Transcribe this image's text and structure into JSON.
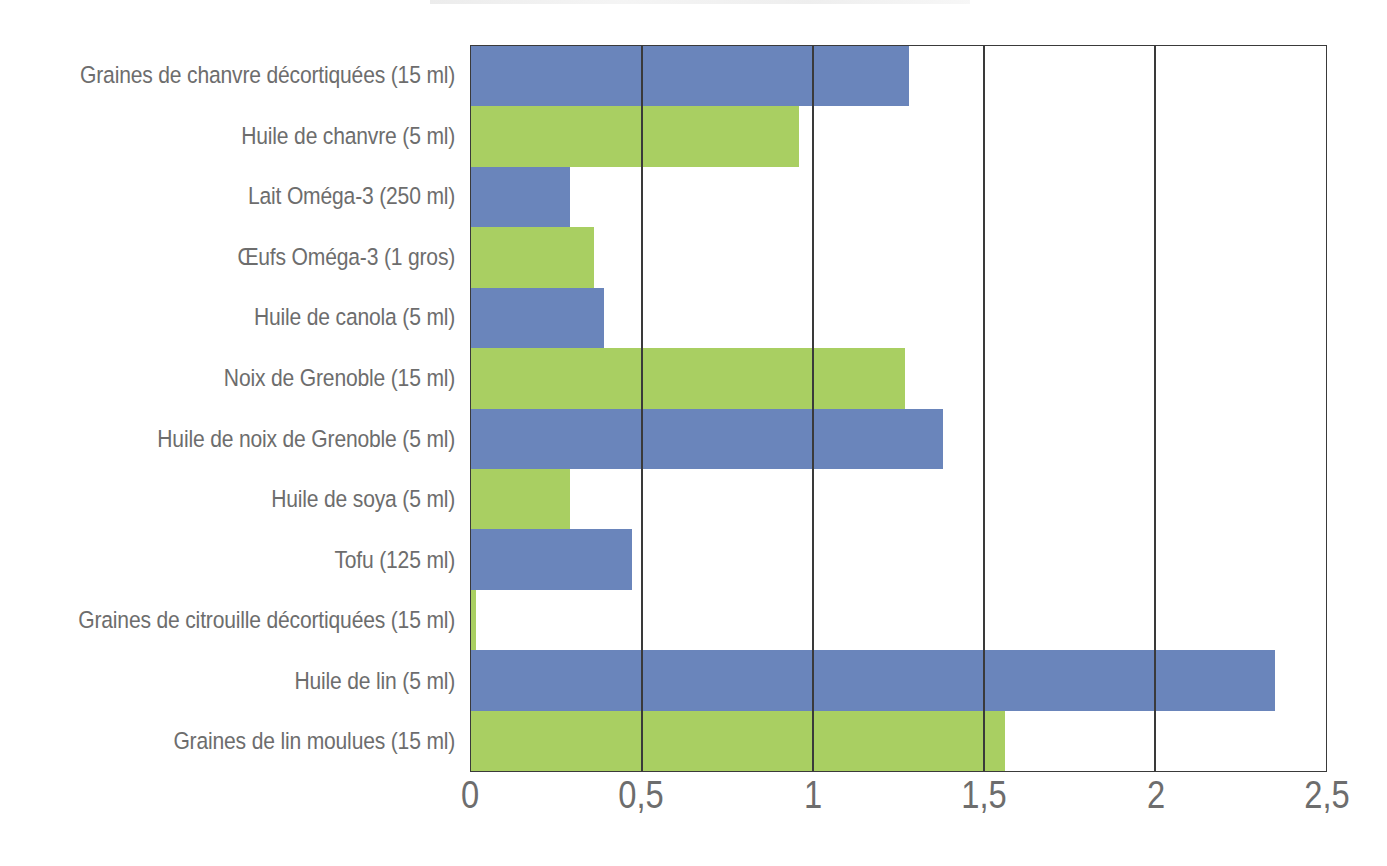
{
  "chart_data": {
    "type": "bar",
    "orientation": "horizontal",
    "title": "",
    "xlabel": "",
    "ylabel": "",
    "xlim": [
      0,
      2.5
    ],
    "xticks": [
      0,
      0.5,
      1,
      1.5,
      2,
      2.5
    ],
    "xtick_labels": [
      "0",
      "0,5",
      "1",
      "1,5",
      "2",
      "2,5"
    ],
    "grid": true,
    "grid_axis": "x",
    "legend": null,
    "categories": [
      "Graines de chanvre décortiquées (15 ml)",
      "Huile de chanvre (5 ml)",
      "Lait Oméga-3 (250 ml)",
      "Œufs Oméga-3 (1 gros)",
      "Huile de canola (5 ml)",
      "Noix de Grenoble (15 ml)",
      "Huile de noix de Grenoble (5 ml)",
      "Huile de soya (5 ml)",
      "Tofu (125 ml)",
      "Graines de citrouille décortiquées (15 ml)",
      "Huile de lin (5 ml)",
      "Graines de lin moulues (15 ml)"
    ],
    "values": [
      1.28,
      0.96,
      0.29,
      0.36,
      0.39,
      1.27,
      1.38,
      0.29,
      0.47,
      0.015,
      2.35,
      1.56
    ],
    "bar_colors": [
      "#6a85bb",
      "#a9cf62",
      "#6a85bb",
      "#a9cf62",
      "#6a85bb",
      "#a9cf62",
      "#6a85bb",
      "#a9cf62",
      "#6a85bb",
      "#a9cf62",
      "#6a85bb",
      "#a9cf62"
    ],
    "colors": {
      "blue": "#6a85bb",
      "green": "#a9cf62",
      "axis": "#3a3a3a",
      "text": "#6d6d6d",
      "background": "#ffffff"
    }
  }
}
